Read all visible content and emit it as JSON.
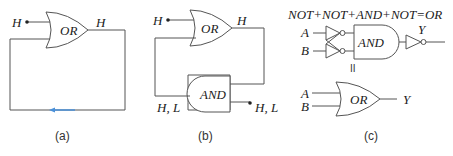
{
  "panels": [
    {
      "id": "a",
      "caption": "(a)",
      "gate_label": "OR",
      "input_label": "H",
      "output_label": "H",
      "arrow_color": "#4a90d9"
    },
    {
      "id": "b",
      "caption": "(b)",
      "or_gate_label": "OR",
      "and_gate_label": "AND",
      "input_label": "H",
      "or_output_label": "H",
      "feedback_label": "H, L",
      "and_output_label": "H, L"
    },
    {
      "id": "c",
      "caption": "(c)",
      "equation": "NOT+NOT+AND+NOT=OR",
      "input_a": "A",
      "input_b": "B",
      "and_gate_label": "AND",
      "output_top": "Y",
      "equals_symbol": "II",
      "input_a2": "A",
      "input_b2": "B",
      "or_gate_label": "OR",
      "output_bottom": "Y"
    }
  ]
}
